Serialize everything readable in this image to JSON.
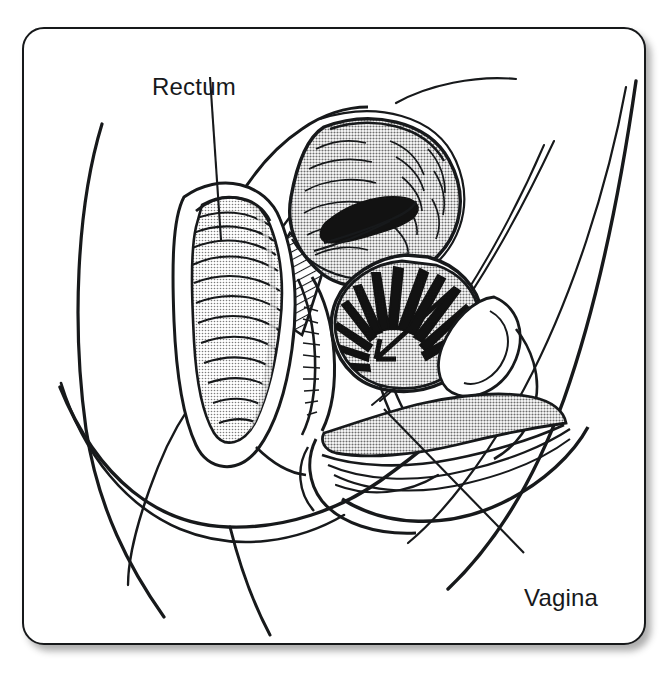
{
  "figure": {
    "kind": "anatomical-illustration",
    "view": "female pelvis midsagittal section",
    "style": "black ink line drawing with halftone gray shading",
    "background_color": "#ffffff",
    "frame": {
      "border_color": "#16181a",
      "corner_radius_px": 22,
      "has_drop_shadow": true
    }
  },
  "labels": [
    {
      "id": "rectum",
      "text": "Rectum",
      "x": 128,
      "y": 44,
      "leader": {
        "x1": 208,
        "y1": 75,
        "x2": 219,
        "y2": 238
      }
    },
    {
      "id": "vagina",
      "text": "Vagina",
      "x": 500,
      "y": 555,
      "leader": {
        "x1": 382,
        "y1": 407,
        "x2": 522,
        "y2": 551
      }
    }
  ],
  "structures": [
    {
      "id": "body-outline",
      "name": "torso and thigh contour",
      "shading": "none",
      "stroke": "#17191b"
    },
    {
      "id": "rectum",
      "name": "rectum",
      "shading": "light-gray",
      "fill": "#bdbdbd"
    },
    {
      "id": "uterus",
      "name": "uterus",
      "shading": "mid-gray",
      "fill": "#a9a9a9"
    },
    {
      "id": "uterine-cavity",
      "name": "uterine cavity",
      "shading": "solid-black",
      "fill": "#121212"
    },
    {
      "id": "bladder",
      "name": "bladder with rugae",
      "shading": "mid-gray",
      "fill": "#a9a9a9"
    },
    {
      "id": "vagina",
      "name": "vaginal canal",
      "shading": "mid-gray",
      "fill": "#aaaaaa"
    },
    {
      "id": "sacrum-wedge",
      "name": "hatched sacral wedge",
      "shading": "hatching",
      "fill": "#ffffff"
    },
    {
      "id": "pubic-bone",
      "name": "pubic symphysis",
      "shading": "none",
      "fill": "#ffffff"
    }
  ],
  "colors": {
    "ink": "#17191b",
    "gray_mid": "#a9a9a9",
    "gray_light": "#c4c4c4",
    "black_fill": "#121212",
    "paper": "#ffffff"
  }
}
